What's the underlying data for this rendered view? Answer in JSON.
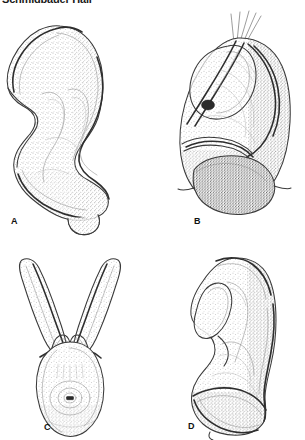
{
  "page": {
    "width": 305,
    "height": 440,
    "background_color": "#ffffff",
    "running_head": "Schmidbauer Hall"
  },
  "figure": {
    "type": "scientific-illustration-plate",
    "style": "stippled ink line drawing",
    "panel_count": 4,
    "panels": [
      {
        "id": "A",
        "label": "A",
        "position": "top-left",
        "description": "Lateral view of sclerotized plate with deep anterior concavity and sinuous posterior margin"
      },
      {
        "id": "B",
        "label": "B",
        "position": "top-right",
        "description": "Lateral view of complex capsule bearing elongate apodeme and apical setae"
      },
      {
        "id": "C",
        "label": "C",
        "position": "bottom-left",
        "description": "Ventral view of Y-shaped forked structure with paired arms and median aperture"
      },
      {
        "id": "D",
        "label": "D",
        "position": "bottom-right",
        "description": "Lateral view of elongate lobed sclerite with basal expansion"
      }
    ]
  },
  "colors": {
    "background": "#ffffff",
    "outline_dark": "#3a3a3a",
    "rim_dark": "#2e2e2e",
    "inner_line": "#8e8e8e",
    "fine_line": "#a8a8a8",
    "stipple": "#707070",
    "label_text": "#111111",
    "running_head_text": "#1a1a1a"
  }
}
